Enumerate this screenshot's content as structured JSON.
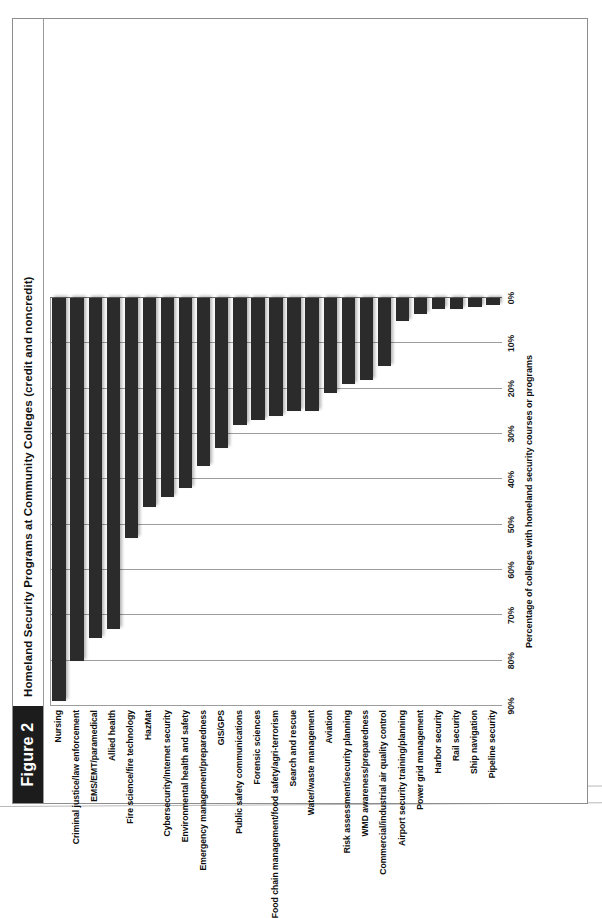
{
  "figure": {
    "tag": "Figure 2",
    "caption": "Homeland Security Programs at Community Colleges (credit and noncredit)"
  },
  "chart_data": {
    "type": "bar",
    "orientation": "horizontal",
    "title": "Homeland Security Programs at Community Colleges (credit and noncredit)",
    "xlabel": "Percentage of colleges with homeland security courses or programs",
    "ylabel": "",
    "xlim": [
      0,
      90
    ],
    "grid": true,
    "legend": null,
    "tick_labels": [
      "0%",
      "10%",
      "20%",
      "30%",
      "40%",
      "50%",
      "60%",
      "70%",
      "80%",
      "90%"
    ],
    "tick_values": [
      0,
      10,
      20,
      30,
      40,
      50,
      60,
      70,
      80,
      90
    ],
    "bar_color": "#2b2b2b",
    "categories": [
      "Nursing",
      "Criminal justice/law enforcement",
      "EMS/EMT/paramedical",
      "Allied health",
      "Fire science/fire technology",
      "HazMat",
      "Cybersecurity/Internet security",
      "Environmental health and safety",
      "Emergency management/preparedness",
      "GIS/GPS",
      "Public safety communications",
      "Forensic sciences",
      "Food chain management/food safety/agri-terrorism",
      "Search and rescue",
      "Water/waste management",
      "Aviation",
      "Risk assessment/security planning",
      "WMD awareness/preparedness",
      "Commercial/industrial air quality control",
      "Airport security training/planning",
      "Power grid management",
      "Harbor security",
      "Rail security",
      "Ship navigation",
      "Pipeline security"
    ],
    "values": [
      89,
      80,
      75,
      73,
      53,
      46,
      44,
      42,
      37,
      33,
      28,
      27,
      26,
      25,
      25,
      21,
      19,
      18,
      15,
      5,
      3.5,
      2.5,
      2.5,
      2,
      1.5
    ]
  }
}
